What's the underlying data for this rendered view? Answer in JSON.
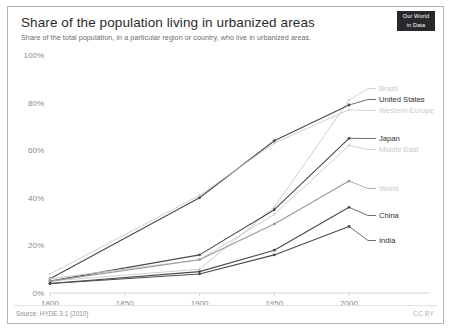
{
  "header": {
    "title": "Share of the population living in urbanized areas",
    "subtitle": "Share of the total population, in a particular region or country, who live in urbanized areas.",
    "logo_line1": "Our World",
    "logo_line2": "in Data"
  },
  "footer": {
    "source": "Source: HYDE 3.1 (2010)",
    "license": "CC BY"
  },
  "chart_data": {
    "type": "line",
    "title": "Share of the population living in urbanized areas",
    "subtitle": "Share of the total population, in a particular region or country, who live in urbanized areas.",
    "xlabel": "",
    "ylabel": "",
    "xlim": [
      1800,
      2010
    ],
    "ylim": [
      0,
      100
    ],
    "xticks": [
      1800,
      1850,
      1900,
      1950,
      2000
    ],
    "xtick_labels": [
      "1800",
      "1850",
      "1900",
      "1950",
      "2000"
    ],
    "yticks": [
      0,
      20,
      40,
      60,
      80,
      100
    ],
    "ytick_labels": [
      "0%",
      "20%",
      "40%",
      "60%",
      "80%",
      "100%"
    ],
    "grid": false,
    "legend_position": "inline-right",
    "x": [
      1800,
      1900,
      1950,
      2000
    ],
    "series": [
      {
        "name": "Brazil",
        "values": [
          5,
          10,
          36,
          81
        ],
        "color": "#c9c9c9",
        "emphasis": "faint"
      },
      {
        "name": "United States",
        "values": [
          6,
          40,
          64,
          79
        ],
        "color": "#4a4a4a",
        "emphasis": "strong"
      },
      {
        "name": "Western Europe",
        "values": [
          8,
          41,
          63,
          77
        ],
        "color": "#c9c9c9",
        "emphasis": "faint"
      },
      {
        "name": "Japan",
        "values": [
          5,
          16,
          35,
          65
        ],
        "color": "#4a4a4a",
        "emphasis": "strong"
      },
      {
        "name": "Middle East",
        "values": [
          6,
          14,
          33,
          62
        ],
        "color": "#c9c9c9",
        "emphasis": "faint"
      },
      {
        "name": "World",
        "values": [
          5,
          14,
          29,
          47
        ],
        "color": "#9a9a9a",
        "emphasis": "mid"
      },
      {
        "name": "China",
        "values": [
          4,
          9,
          18,
          36
        ],
        "color": "#4a4a4a",
        "emphasis": "strong"
      },
      {
        "name": "India",
        "values": [
          4,
          8,
          16,
          28
        ],
        "color": "#4a4a4a",
        "emphasis": "strong"
      }
    ]
  }
}
